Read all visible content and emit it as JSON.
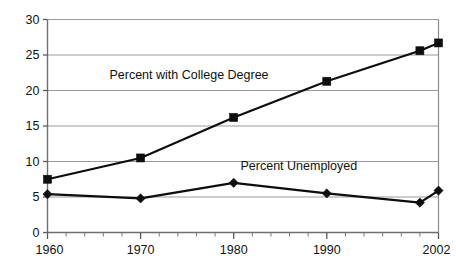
{
  "chart_data": {
    "type": "line",
    "title": "",
    "subtitle": "",
    "xlabel": "",
    "ylabel": "",
    "x": [
      1960,
      1970,
      1980,
      1990,
      2000,
      2002
    ],
    "xlim": [
      1960,
      2002
    ],
    "ylim": [
      0,
      30
    ],
    "grid": true,
    "legend_position": "inline-annotations",
    "y_ticks": [
      "0",
      "5",
      "10",
      "15",
      "20",
      "25",
      "30"
    ],
    "y_tick_values": [
      0,
      5,
      10,
      15,
      20,
      25,
      30
    ],
    "x_ticks": [
      "1960",
      "1970",
      "1980",
      "1990",
      "2002"
    ],
    "x_tick_values": [
      1960,
      1970,
      1980,
      1990,
      2002
    ],
    "x_minor_tick_interval": 2,
    "series": [
      {
        "name": "Percent with College Degree",
        "marker": "square",
        "color": "#0d0d0d",
        "x": [
          1960,
          1970,
          1980,
          1990,
          2000,
          2002
        ],
        "values": [
          7.5,
          10.5,
          16.2,
          21.3,
          25.6,
          26.7
        ]
      },
      {
        "name": "Percent Unemployed",
        "marker": "diamond",
        "color": "#0d0d0d",
        "x": [
          1960,
          1970,
          1980,
          1990,
          2000,
          2002
        ],
        "values": [
          5.4,
          4.8,
          7.0,
          5.5,
          4.2,
          5.9
        ]
      }
    ],
    "annotations": [
      {
        "text": "Percent with College Degree",
        "x": 1975.2,
        "y": 21.6,
        "series": "Percent with College Degree"
      },
      {
        "text": "Percent Unemployed",
        "x": 1987.0,
        "y": 8.8,
        "series": "Percent Unemployed"
      }
    ]
  },
  "colors": {
    "ink": "#0d0d0d",
    "grid": "#9a9a9a",
    "axis": "#6f6f6f",
    "background": "#ffffff"
  }
}
